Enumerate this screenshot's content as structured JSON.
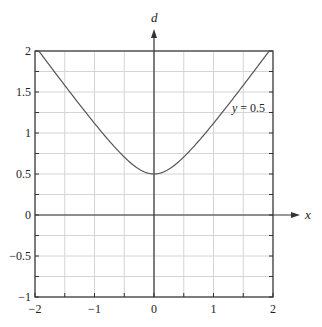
{
  "chart_data": {
    "type": "line",
    "title": "",
    "xlabel": "x",
    "ylabel": "d",
    "xlim": [
      -2,
      2
    ],
    "ylim": [
      -1,
      2
    ],
    "grid": true,
    "xticks": [
      -2,
      -1,
      0,
      1,
      2
    ],
    "xtick_labels": [
      "−2",
      "−1",
      "0",
      "1",
      "2"
    ],
    "yticks": [
      -1,
      -0.5,
      0,
      0.5,
      1,
      1.5,
      2
    ],
    "ytick_labels": [
      "−1",
      "−0.5",
      "0",
      "0.5",
      "1",
      "1.5",
      "2"
    ],
    "minor_grid_step_x": 0.5,
    "minor_grid_step_y": 0.25,
    "series": [
      {
        "name": "y = 0.5",
        "function": "d = sqrt(x^2 + 0.25)",
        "x": [
          -2,
          -1.5,
          -1,
          -0.5,
          0,
          0.5,
          1,
          1.5,
          2
        ],
        "values": [
          2.0,
          1.58,
          1.12,
          0.71,
          0.5,
          0.71,
          1.12,
          1.58,
          2.0
        ]
      }
    ],
    "annotations": [
      {
        "text": "y = 0.5",
        "x": 1.55,
        "y": 1.45
      }
    ],
    "legend": "none"
  },
  "labels": {
    "x_axis": "x",
    "y_axis": "d",
    "curve_label_var": "y",
    "curve_label_rest": " = 0.5"
  },
  "colors": {
    "curve": "#555555",
    "axes": "#333333",
    "grid": "#d4d4d4",
    "frame": "#333333"
  }
}
